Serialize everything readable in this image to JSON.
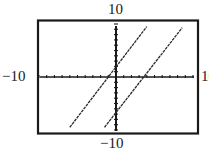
{
  "chart_data": {
    "type": "line",
    "title": "",
    "xlabel": "",
    "ylabel": "",
    "xlim": [
      -10,
      10
    ],
    "ylim": [
      -10,
      10
    ],
    "x_tick_step": 1,
    "y_tick_step": 1,
    "grid": false,
    "window_labels": {
      "ymax": "10",
      "ymin": "−10",
      "xmin": "−10",
      "xmax": "10"
    },
    "series": [
      {
        "name": "line-1",
        "description": "Upper-left parallel line, x-intercept about -1, y-intercept about 2",
        "points": [
          [
            -6.0,
            -9.5
          ],
          [
            4.0,
            9.5
          ]
        ],
        "approx_equation": "y = 2x + 2"
      },
      {
        "name": "line-2",
        "description": "Lower-right parallel line, x-intercept about 3.5, y-intercept about -7",
        "points": [
          [
            -1.5,
            -9.5
          ],
          [
            8.6,
            9.3
          ]
        ],
        "approx_equation": "y = 2x - 7"
      }
    ],
    "colors": {
      "axis": "#1a1a1a",
      "frame": "#1a1a1a",
      "lines": "#2a2a2a",
      "background": "#ffffff"
    }
  },
  "labels": {
    "top": "10",
    "bottom": "−10",
    "left": "−10",
    "right": "10"
  }
}
